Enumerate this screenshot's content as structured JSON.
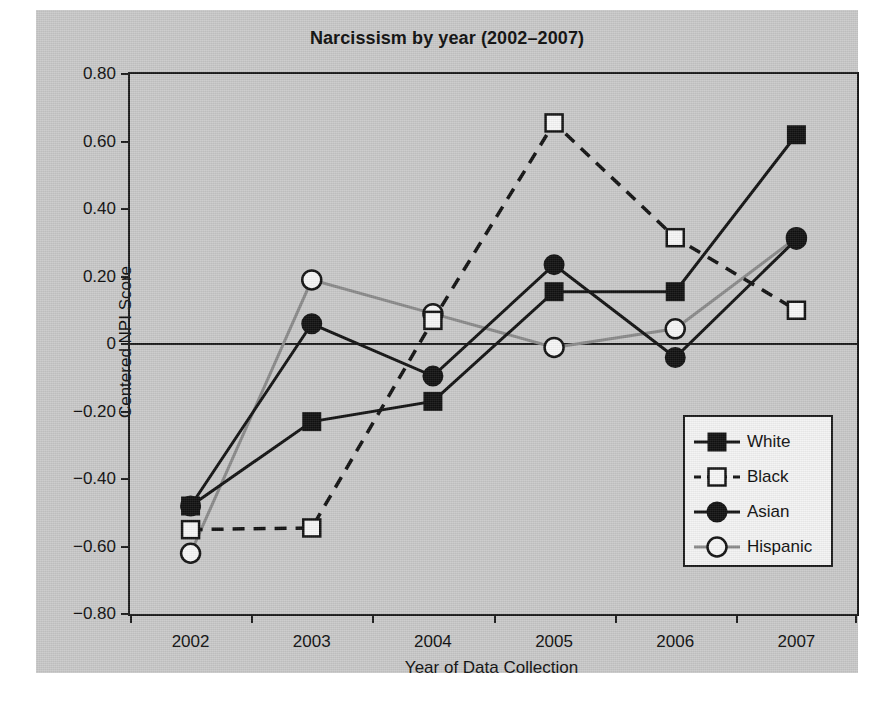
{
  "chart_data": {
    "type": "line",
    "title": "Narcissism by year (2002–2007)",
    "xlabel": "Year of Data Collection",
    "ylabel": "Centered NPI Score",
    "categories": [
      "2002",
      "2003",
      "2004",
      "2005",
      "2006",
      "2007"
    ],
    "x_tick_labels": [
      "2002",
      "2003",
      "2004",
      "2005",
      "2006",
      "2007"
    ],
    "y_tick_labels": [
      "0.80",
      "0.60",
      "0.40",
      "0.20",
      "0",
      "−0.20",
      "−0.40",
      "−0.60",
      "−0.80"
    ],
    "y_tick_values": [
      0.8,
      0.6,
      0.4,
      0.2,
      0,
      -0.2,
      -0.4,
      -0.6,
      -0.8
    ],
    "ylim": [
      -0.8,
      0.8
    ],
    "grid": false,
    "legend_position": "lower-right-inside",
    "zero_line": true,
    "series": [
      {
        "name": "White",
        "marker": "filled-square",
        "line_style": "solid",
        "color": "#111111",
        "values": [
          -0.48,
          -0.23,
          -0.17,
          0.155,
          0.155,
          0.62
        ]
      },
      {
        "name": "Black",
        "marker": "open-square",
        "line_style": "dashed",
        "color": "#111111",
        "values": [
          -0.55,
          -0.545,
          0.07,
          0.655,
          0.315,
          0.1
        ]
      },
      {
        "name": "Asian",
        "marker": "filled-circle",
        "line_style": "solid",
        "color": "#111111",
        "values": [
          -0.48,
          0.06,
          -0.095,
          0.235,
          -0.04,
          0.31
        ]
      },
      {
        "name": "Hispanic",
        "marker": "open-circle",
        "line_style": "solid",
        "color": "#8a8a8a",
        "values": [
          -0.62,
          0.19,
          0.09,
          -0.01,
          0.045,
          0.315
        ]
      }
    ]
  },
  "legend": {
    "items": [
      {
        "label": "White"
      },
      {
        "label": "Black"
      },
      {
        "label": "Asian"
      },
      {
        "label": "Hispanic"
      }
    ]
  },
  "colors": {
    "figure_background": "#c9c9c9",
    "axis": "#1a1a1a",
    "text": "#0d0d0d",
    "hispanic_gray": "#8a8a8a",
    "legend_background": "#f4f4f4"
  }
}
